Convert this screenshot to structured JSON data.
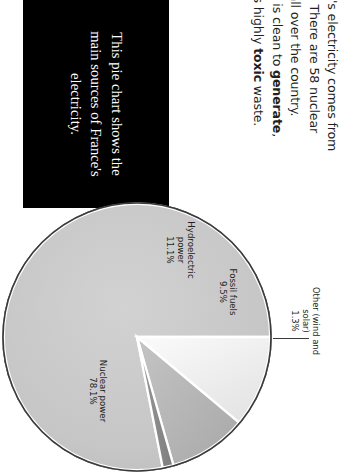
{
  "callout": {
    "text": "This pie chart shows the main sources of France's electricity.",
    "background": "#000000",
    "color": "#ffffff"
  },
  "body_copy": {
    "part1": "Most of France's electricity comes from nuclear power. There are 58 nuclear power plants all over the country. Nuclear power is clean to ",
    "bold1": "generate",
    "part2": ", but it produces highly ",
    "bold2": "toxic",
    "part3": " waste."
  },
  "chart_data": {
    "type": "pie",
    "title": "",
    "categories": [
      "Hydroelectric power",
      "Fossil fuels",
      "Other (wind and solar)",
      "Nuclear power"
    ],
    "values": [
      11.1,
      9.5,
      1.3,
      78.1
    ],
    "unit": "%",
    "labels": [
      {
        "name": "Hydroelectric\npower",
        "value": "11.1%",
        "color": "#f1f1f1"
      },
      {
        "name": "Fossil fuels",
        "value": "9.5%",
        "color": "#b4b4b4"
      },
      {
        "name": "Other (wind and solar)",
        "value": "1.3%",
        "color": "#8c8c8c"
      },
      {
        "name": "Nuclear power",
        "value": "78.1%",
        "color": "#c6c6c6"
      }
    ],
    "legend": "labels-on-slices",
    "grid": false,
    "start_angle_deg": 0,
    "direction": "clockwise",
    "rotation_deg": 90,
    "stroke": "#ffffff",
    "outline": "#3a3a3a"
  },
  "slice_labels": {
    "hydro": "Hydroelectric\npower\n11.1%",
    "fossil": "Fossil fuels\n9.5%",
    "nuclear": "Nuclear power\n78.1%",
    "other": "Other (wind and solar)\n1.3%"
  }
}
